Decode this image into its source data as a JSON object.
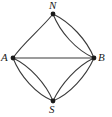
{
  "figure": {
    "kind": "graph-diagram",
    "width": 112,
    "height": 117,
    "background_color": "#ffffff",
    "stroke_color": "#3a3a3a",
    "label_color": "#1a1a1a"
  },
  "nodes": [
    {
      "id": "N",
      "label": "N",
      "x": 53,
      "y": 14,
      "label_x": 49,
      "label_y": 0
    },
    {
      "id": "A",
      "label": "A",
      "x": 13,
      "y": 58,
      "label_x": 1,
      "label_y": 52
    },
    {
      "id": "B",
      "label": "B",
      "x": 94,
      "y": 58,
      "label_x": 98,
      "label_y": 52
    },
    {
      "id": "S",
      "label": "S",
      "x": 53,
      "y": 101,
      "label_x": 49,
      "label_y": 104
    }
  ],
  "edges": [
    {
      "id": "A-B",
      "from": "A",
      "to": "B",
      "shape": "straight"
    },
    {
      "id": "N-A",
      "from": "N",
      "to": "A",
      "shape": "curve-outer"
    },
    {
      "id": "N-B-outer",
      "from": "N",
      "to": "B",
      "shape": "curve-outer"
    },
    {
      "id": "N-B-inner",
      "from": "N",
      "to": "B",
      "shape": "curve-inner"
    },
    {
      "id": "A-S-outer",
      "from": "A",
      "to": "S",
      "shape": "curve-outer"
    },
    {
      "id": "A-S-inner",
      "from": "A",
      "to": "S",
      "shape": "curve-inner"
    },
    {
      "id": "S-B-outer",
      "from": "S",
      "to": "B",
      "shape": "curve-outer"
    },
    {
      "id": "S-B-inner",
      "from": "S",
      "to": "B",
      "shape": "curve-inner"
    }
  ],
  "paths": {
    "edge_A_B": "M 13 58 L 94 58",
    "edge_N_A": "M 53 14 C 40 30 22 44 13 58",
    "edge_N_B_outer": "M 53 14 C 70 22 87 40 94 58",
    "edge_N_B_inner": "M 53 14 C 60 32 76 50 94 58",
    "edge_A_S_outer": "M 13 58 C 20 76 36 94 53 101",
    "edge_A_S_inner": "M 13 58 C 30 66 46 84 53 101",
    "edge_S_B_outer": "M 53 101 C 70 94 86 76 94 58",
    "edge_S_B_inner": "M 53 101 C 61 84 77 66 94 58"
  }
}
